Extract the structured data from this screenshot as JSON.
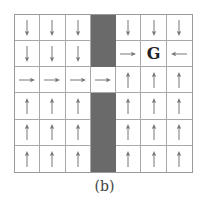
{
  "figure": {
    "caption": "(b)",
    "rows": 6,
    "cols": 7,
    "goal_label": "G",
    "colors": {
      "wall": "#6a6a6a",
      "arrow": "#777777",
      "grid_line": "#a8a8a8",
      "goal_text": "#222222"
    },
    "grid": [
      [
        "down",
        "down",
        "down",
        "wall",
        "down",
        "down",
        "down"
      ],
      [
        "down",
        "down",
        "down",
        "wall",
        "right",
        "goal",
        "left"
      ],
      [
        "right",
        "right",
        "right",
        "right",
        "up",
        "up",
        "up"
      ],
      [
        "up",
        "up",
        "up",
        "wall",
        "up",
        "up",
        "up"
      ],
      [
        "up",
        "up",
        "up",
        "wall",
        "up",
        "up",
        "up"
      ],
      [
        "up",
        "up",
        "up",
        "wall",
        "up",
        "up",
        "up"
      ]
    ]
  }
}
